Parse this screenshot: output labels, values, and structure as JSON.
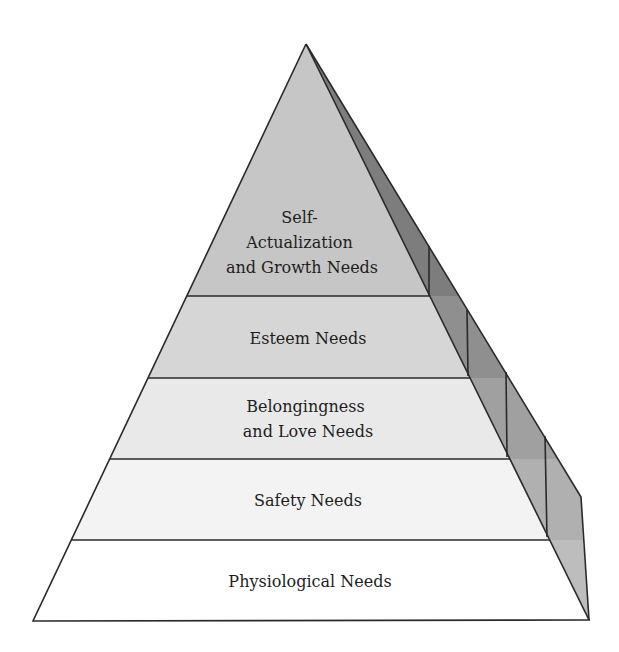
{
  "diagram": {
    "type": "pyramid",
    "levels": [
      {
        "lines": [
          "Self-",
          "Actualization",
          "and Growth Needs"
        ],
        "fill": "#c6c6c6",
        "side_fill": "#7d7d7d"
      },
      {
        "lines": [
          "Esteem Needs"
        ],
        "fill": "#d6d6d6",
        "side_fill": "#8f8f8f"
      },
      {
        "lines": [
          "Belongingness",
          "and Love Needs"
        ],
        "fill": "#e9e9e9",
        "side_fill": "#a0a0a0"
      },
      {
        "lines": [
          "Safety Needs"
        ],
        "fill": "#f3f3f3",
        "side_fill": "#b0b0b0"
      },
      {
        "lines": [
          "Physiological Needs"
        ],
        "fill": "#ffffff",
        "side_fill": "#bdbdbd"
      }
    ]
  }
}
